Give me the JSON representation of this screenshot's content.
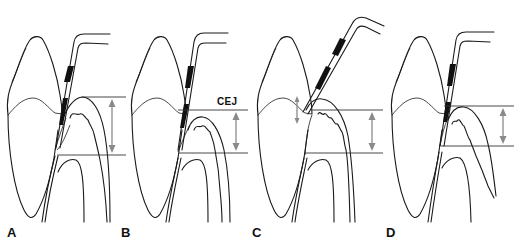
{
  "figure": {
    "panels": [
      {
        "id": "A",
        "label": "A"
      },
      {
        "id": "B",
        "label": "B",
        "annotation": "CEJ"
      },
      {
        "id": "C",
        "label": "C"
      },
      {
        "id": "D",
        "label": "D"
      }
    ],
    "colors": {
      "line": "#1a1a1a",
      "measurement_arrow": "#8a8a8a",
      "probe_band": "#111111",
      "background": "#ffffff"
    }
  }
}
